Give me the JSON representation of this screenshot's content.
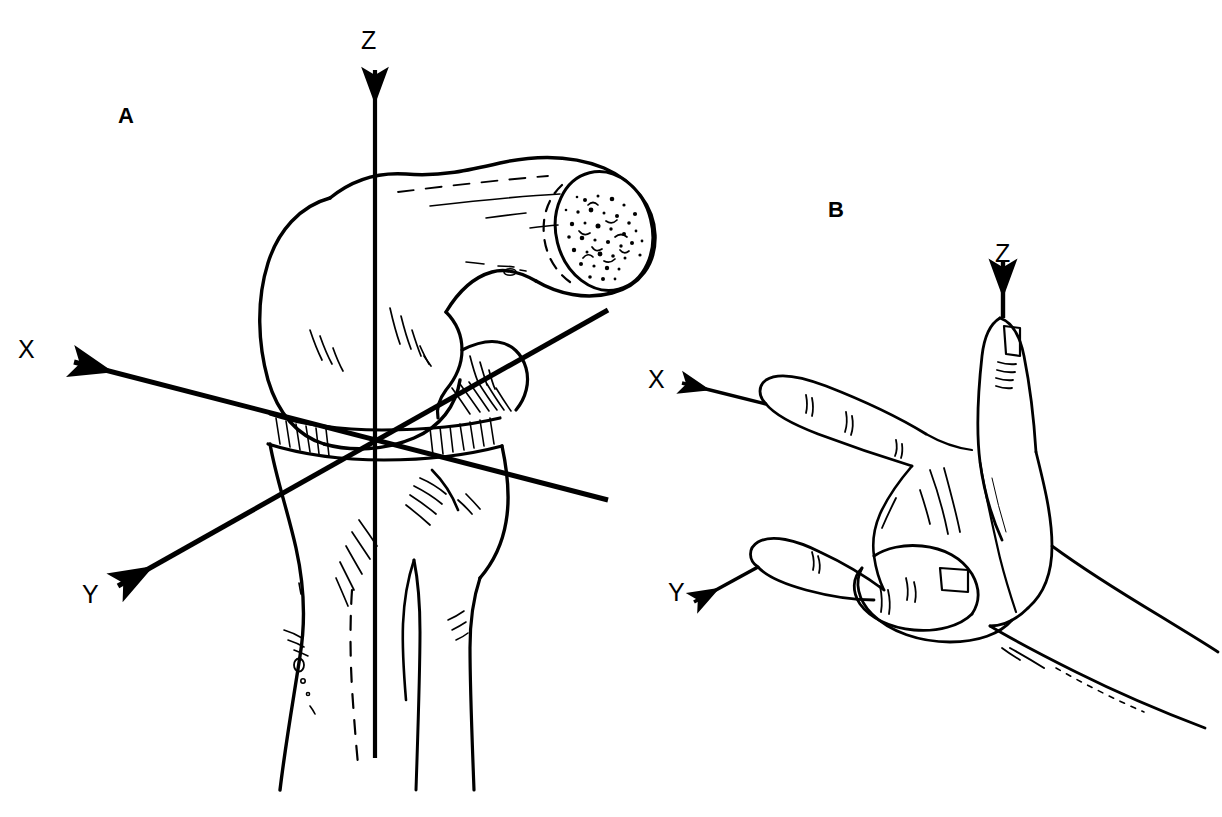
{
  "figure": {
    "background_color": "#ffffff",
    "ink_color": "#000000",
    "width": 1222,
    "height": 817,
    "type": "anatomical-line-drawing"
  },
  "panels": [
    {
      "id": "A",
      "label": "A",
      "subject": "knee-joint",
      "description": "Right knee joint in lateral view with femur, patella, tibia and fibula, overlaid with an orthogonal XYZ coordinate system whose origin lies at the joint center",
      "axes": [
        {
          "name": "X",
          "label": "X",
          "direction": "upper-left",
          "arrow": true
        },
        {
          "name": "Y",
          "label": "Y",
          "direction": "lower-left",
          "arrow": true
        },
        {
          "name": "Z",
          "label": "Z",
          "direction": "up",
          "arrow": true
        }
      ]
    },
    {
      "id": "B",
      "label": "B",
      "subject": "right-hand-rule",
      "description": "Right hand demonstrating the right-hand rule: index finger points along X, middle finger along Y, thumb along Z",
      "axes": [
        {
          "name": "X",
          "label": "X",
          "direction": "left",
          "arrow": true,
          "digit": "index-finger"
        },
        {
          "name": "Y",
          "label": "Y",
          "direction": "lower-left",
          "arrow": true,
          "digit": "middle-finger"
        },
        {
          "name": "Z",
          "label": "Z",
          "direction": "up",
          "arrow": true,
          "digit": "thumb"
        }
      ]
    }
  ],
  "labels": {
    "panel_a": "A",
    "panel_b": "B",
    "a_axis_x": "X",
    "a_axis_y": "Y",
    "a_axis_z": "Z",
    "b_axis_x": "X",
    "b_axis_y": "Y",
    "b_axis_z": "Z"
  }
}
